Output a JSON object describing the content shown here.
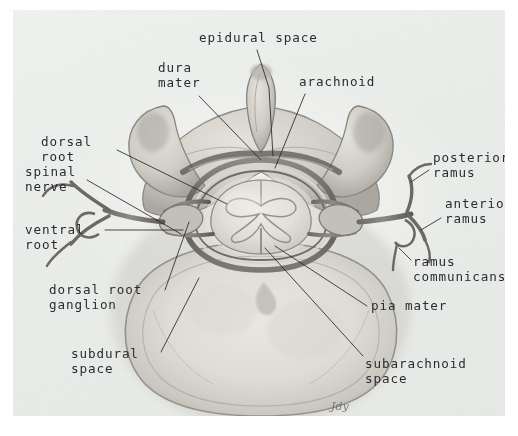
{
  "figure": {
    "signature": "Jdy",
    "plate_background_color": "#eceeec",
    "ink_color": "#2a2c30",
    "leader_color": "#26282c"
  },
  "labels": [
    {
      "id": "epidural-space",
      "lines": [
        "epidural space"
      ],
      "text_x": 186,
      "text_y": 32,
      "anchor": "start",
      "leader": "M 244 40 L 256 78 L 260 146",
      "leader_points": [
        [
          244,
          40
        ],
        [
          256,
          78
        ],
        [
          260,
          146
        ]
      ]
    },
    {
      "id": "dura-mater",
      "lines": [
        "dura",
        "mater"
      ],
      "text_x": 145,
      "text_y": 62,
      "anchor": "start",
      "leader": "M 186 86 L 248 150",
      "leader_points": [
        [
          186,
          86
        ],
        [
          248,
          150
        ]
      ]
    },
    {
      "id": "arachnoid",
      "lines": [
        "arachnoid"
      ],
      "text_x": 286,
      "text_y": 76,
      "anchor": "start",
      "leader": "M 292 84 L 262 158",
      "leader_points": [
        [
          292,
          84
        ],
        [
          262,
          158
        ]
      ]
    },
    {
      "id": "dorsal-root",
      "lines": [
        "dorsal",
        "root"
      ],
      "text_x": 28,
      "text_y": 136,
      "anchor": "start",
      "leader": "M 104 140 L 214 194",
      "leader_points": [
        [
          104,
          140
        ],
        [
          214,
          194
        ]
      ]
    },
    {
      "id": "spinal-nerve",
      "lines": [
        "spinal",
        "nerve"
      ],
      "text_x": 12,
      "text_y": 166,
      "anchor": "start",
      "leader": "M 74 170 L 168 224",
      "leader_points": [
        [
          74,
          170
        ],
        [
          168,
          224
        ]
      ]
    },
    {
      "id": "posterior-ramus",
      "lines": [
        "posterior",
        "ramus"
      ],
      "text_x": 420,
      "text_y": 152,
      "anchor": "start",
      "leader": "M 416 160 L 398 172",
      "leader_points": [
        [
          416,
          160
        ],
        [
          398,
          172
        ]
      ]
    },
    {
      "id": "anterior-ramus",
      "lines": [
        "anterior",
        "ramus"
      ],
      "text_x": 432,
      "text_y": 198,
      "anchor": "start",
      "leader": "M 428 208 L 408 220",
      "leader_points": [
        [
          428,
          208
        ],
        [
          408,
          220
        ]
      ]
    },
    {
      "id": "ventral-root",
      "lines": [
        "ventral",
        "root"
      ],
      "text_x": 12,
      "text_y": 224,
      "anchor": "start",
      "leader": "M 92 220 L 170 220",
      "leader_points": [
        [
          92,
          220
        ],
        [
          170,
          220
        ]
      ]
    },
    {
      "id": "ramus-communicans",
      "lines": [
        "ramus",
        "communicans"
      ],
      "text_x": 400,
      "text_y": 256,
      "anchor": "start",
      "leader": "M 398 250 L 386 238",
      "leader_points": [
        [
          398,
          250
        ],
        [
          386,
          238
        ]
      ]
    },
    {
      "id": "dorsal-root-ganglion",
      "lines": [
        "dorsal root",
        "ganglion"
      ],
      "text_x": 36,
      "text_y": 284,
      "anchor": "start",
      "leader": "M 152 280 L 176 212",
      "leader_points": [
        [
          152,
          280
        ],
        [
          176,
          212
        ]
      ]
    },
    {
      "id": "pia-mater",
      "lines": [
        "pia mater"
      ],
      "text_x": 358,
      "text_y": 300,
      "anchor": "start",
      "leader": "M 354 296 L 262 236",
      "leader_points": [
        [
          354,
          296
        ],
        [
          262,
          236
        ]
      ]
    },
    {
      "id": "subdural-space",
      "lines": [
        "subdural",
        "space"
      ],
      "text_x": 58,
      "text_y": 348,
      "anchor": "start",
      "leader": "M 148 342 L 186 268",
      "leader_points": [
        [
          148,
          342
        ],
        [
          186,
          268
        ]
      ]
    },
    {
      "id": "subarachnoid-space",
      "lines": [
        "subarachnoid",
        "space"
      ],
      "text_x": 352,
      "text_y": 358,
      "anchor": "start",
      "leader": "M 350 346 L 252 238",
      "leader_points": [
        [
          350,
          346
        ],
        [
          252,
          238
        ]
      ]
    }
  ],
  "anatomy": {
    "parts": [
      "spinous-process",
      "vertebral-lamina",
      "transverse-process-left",
      "transverse-process-right",
      "vertebral-body",
      "spinal-cord",
      "gray-matter-butterfly",
      "dura-mater-sheath",
      "arachnoid-membrane",
      "epidural-fat",
      "dorsal-root-left",
      "dorsal-root-right",
      "ventral-root-left",
      "ventral-root-right",
      "dorsal-root-ganglion-left",
      "dorsal-root-ganglion-right",
      "posterior-ramus-left",
      "posterior-ramus-right",
      "anterior-ramus-left",
      "anterior-ramus-right",
      "ramus-communicans-left",
      "ramus-communicans-right"
    ]
  }
}
